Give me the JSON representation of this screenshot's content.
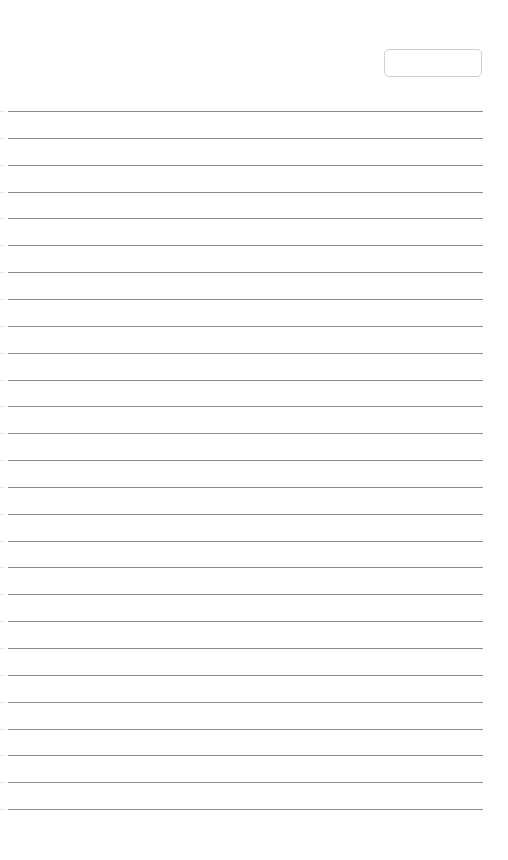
{
  "page": {
    "type": "lined-paper",
    "background": "#ffffff",
    "rule_color": "#8a8a8a",
    "rule_count": 27,
    "rule_start_y": 111,
    "rule_spacing": 26.85
  },
  "header": {
    "date_field": {
      "value": "",
      "placeholder": ""
    }
  },
  "lines": []
}
